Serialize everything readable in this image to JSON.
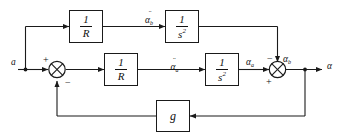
{
  "diagram": {
    "canvas": {
      "width": 342,
      "height": 138
    },
    "stroke_color": "#1a1a1a",
    "background": "#ffffff"
  },
  "signals": {
    "input": "a",
    "output": "α",
    "top_mid": {
      "base": "α",
      "accent": "¨",
      "sub": "b"
    },
    "mid_mid": {
      "base": "α",
      "accent": "¨",
      "sub": "a"
    },
    "mid_out": {
      "base": "α",
      "sub": "a"
    },
    "sum2_top": {
      "base": "α",
      "sub": "b"
    }
  },
  "blocks": [
    {
      "id": "top-gain",
      "name": "block-1-over-R-top",
      "numerator": "1",
      "denominator": "R",
      "denominator_exp": ""
    },
    {
      "id": "top-integrator",
      "name": "block-1-over-s2-top",
      "numerator": "1",
      "denominator": "s",
      "denominator_exp": "2"
    },
    {
      "id": "mid-gain",
      "name": "block-1-over-R-middle",
      "numerator": "1",
      "denominator": "R",
      "denominator_exp": ""
    },
    {
      "id": "mid-integrator",
      "name": "block-1-over-s2-middle",
      "numerator": "1",
      "denominator": "s",
      "denominator_exp": "2"
    },
    {
      "id": "feedback-gain",
      "name": "block-g-feedback",
      "label": "g"
    }
  ],
  "summing_junctions": [
    {
      "id": "sum-left",
      "name": "summing-junction-left",
      "signs": {
        "top_left": "+",
        "bottom": "−"
      }
    },
    {
      "id": "sum-right",
      "name": "summing-junction-right",
      "signs": {
        "top": "−",
        "bottom_left": "+"
      }
    }
  ]
}
